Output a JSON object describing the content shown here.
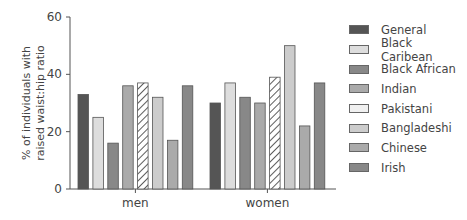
{
  "chart_data": {
    "type": "bar",
    "title": "",
    "xlabel": "",
    "ylabel": "% of individuals with raised waist:hip ratio",
    "ylabel_lines": [
      "% of individuals with",
      "raised waist:hip ratio"
    ],
    "ylim": [
      0,
      60
    ],
    "yticks": [
      0,
      20,
      40,
      60
    ],
    "grid": false,
    "legend_position": "right",
    "categories": [
      "men",
      "women"
    ],
    "series": [
      {
        "name": "General",
        "values": [
          33,
          30
        ],
        "color": "#555555",
        "pattern": "solid"
      },
      {
        "name": "Black Caribean",
        "values": [
          25,
          37
        ],
        "color": "#dddddd",
        "pattern": "solid"
      },
      {
        "name": "Black African",
        "values": [
          16,
          32
        ],
        "color": "#888888",
        "pattern": "solid"
      },
      {
        "name": "Indian",
        "values": [
          36,
          30
        ],
        "color": "#aaaaaa",
        "pattern": "solid"
      },
      {
        "name": "Pakistani",
        "values": [
          37,
          39
        ],
        "color": "#ffffff",
        "pattern": "hatched"
      },
      {
        "name": "Bangladeshi",
        "values": [
          32,
          50
        ],
        "color": "#cccccc",
        "pattern": "solid"
      },
      {
        "name": "Chinese",
        "values": [
          17,
          22
        ],
        "color": "#aaaaaa",
        "pattern": "solid"
      },
      {
        "name": "Irish",
        "values": [
          36,
          37
        ],
        "color": "#888888",
        "pattern": "solid"
      }
    ]
  }
}
